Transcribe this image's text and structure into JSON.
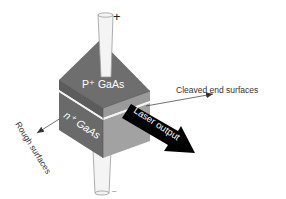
{
  "diagram": {
    "type": "semiconductor-laser-schematic",
    "labels": {
      "top_layer": "P⁺ GaAs",
      "bottom_layer": "n⁺ GaAs",
      "cleaved": "Cleaved end surfaces",
      "rough": "Rough surfaces",
      "laser": "Laser output",
      "plus": "+",
      "minus": "–"
    },
    "colors": {
      "top_face": "#6e6e6e",
      "left_face": "#5c5c5c",
      "right_face": "#9a9a9a",
      "junction": "#f2f2f2",
      "electrode": "#f4f4f4",
      "electrode_edge": "#9a9a9a",
      "arrow": "#000000",
      "label_text": "#333333",
      "laser_text": "#ffffff"
    }
  }
}
